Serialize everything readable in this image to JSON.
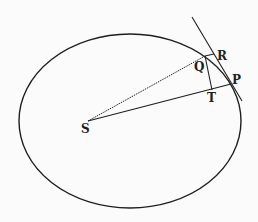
{
  "diagram": {
    "type": "orbit-ellipse-geometry",
    "colors": {
      "background": "#fbfbfb",
      "stroke": "#1e1e1e"
    },
    "ellipse": {
      "cx": 130,
      "cy": 121,
      "rx": 111,
      "ry": 87
    },
    "points": {
      "S": {
        "label": "S",
        "x": 88,
        "y": 121
      },
      "Q": {
        "label": "Q",
        "x": 205,
        "y": 56
      },
      "R": {
        "label": "R",
        "x": 214,
        "y": 54
      },
      "P": {
        "label": "P",
        "x": 231,
        "y": 84
      },
      "T": {
        "label": "T",
        "x": 212,
        "y": 90
      }
    },
    "lines": [
      {
        "name": "SQ",
        "from": "S",
        "to": "Q",
        "style": "dotted"
      },
      {
        "name": "SP",
        "from": "S",
        "to": "P",
        "style": "solid"
      },
      {
        "name": "QT",
        "from": "Q",
        "to": "T",
        "style": "solid"
      },
      {
        "name": "QR",
        "from": "Q",
        "to": "R",
        "style": "solid"
      },
      {
        "name": "tangent-at-P",
        "from": [
          192,
          17
        ],
        "to": [
          242,
          101
        ],
        "style": "solid"
      }
    ]
  },
  "labels": {
    "S": "S",
    "Q": "Q",
    "R": "R",
    "P": "P",
    "T": "T"
  }
}
